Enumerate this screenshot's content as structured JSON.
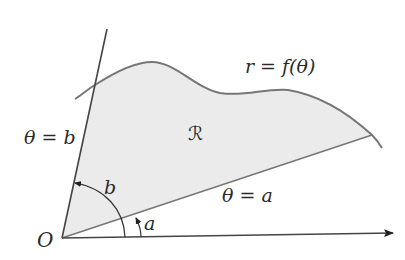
{
  "diagram": {
    "type": "polar-region",
    "labels": {
      "curve": "r = f(θ)",
      "region": "ℛ",
      "ray_b": "θ = b",
      "angle_b": "b",
      "ray_a": "θ = a",
      "angle_a": "a",
      "origin": "O"
    },
    "colors": {
      "region_fill": "#ebebeb",
      "curve_stroke": "#777777",
      "ray_stroke": "#555555",
      "axis_stroke": "#333333",
      "text": "#2a2a2a"
    }
  }
}
